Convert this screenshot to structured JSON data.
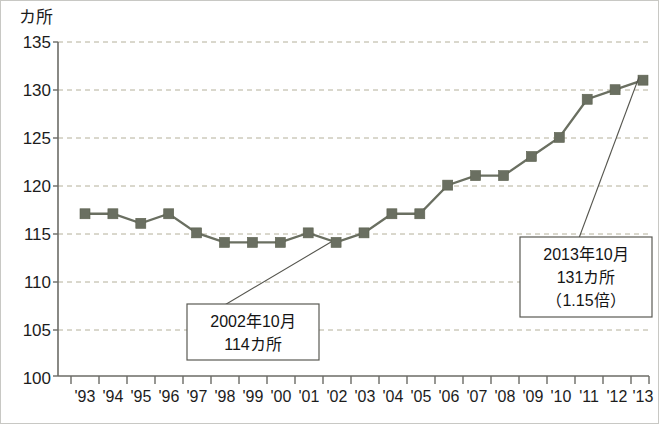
{
  "chart_data": {
    "type": "line",
    "title": "",
    "subtitle": "",
    "xlabel": "",
    "ylabel": "カ所",
    "ylim": [
      100,
      135
    ],
    "yticks": [
      100,
      105,
      110,
      115,
      120,
      125,
      130,
      135
    ],
    "ytick_labels": [
      "100",
      "105",
      "110",
      "115",
      "120",
      "125",
      "130",
      "135"
    ],
    "grid": true,
    "legend": "none",
    "categories": [
      "'93",
      "'94",
      "'95",
      "'96",
      "'97",
      "'98",
      "'99",
      "'00",
      "'01",
      "'02",
      "'03",
      "'04",
      "'05",
      "'06",
      "'07",
      "'08",
      "'09",
      "'10",
      "'11",
      "'12",
      "'13"
    ],
    "values": [
      117,
      117,
      116,
      117,
      115,
      114,
      114,
      114,
      115,
      114,
      115,
      117,
      117,
      120,
      121,
      121,
      123,
      125,
      129,
      130,
      131
    ],
    "series": [
      {
        "name": "カ所",
        "values": [
          117,
          117,
          116,
          117,
          115,
          114,
          114,
          114,
          115,
          114,
          115,
          117,
          117,
          120,
          121,
          121,
          123,
          125,
          129,
          130,
          131
        ]
      }
    ],
    "marker": "square",
    "line_color": "#6a6f61",
    "marker_color": "#6a6f61",
    "grid_color": "#b4b09a",
    "axis_color": "#6b6b66",
    "annotations": [
      {
        "id": "annotation-2002",
        "lines": [
          "2002年10月",
          "114カ所"
        ],
        "target_category": "'02",
        "target_value": 114
      },
      {
        "id": "annotation-2013",
        "lines": [
          "2013年10月",
          "131カ所",
          "（1.15倍）"
        ],
        "target_category": "'13",
        "target_value": 131
      }
    ]
  }
}
